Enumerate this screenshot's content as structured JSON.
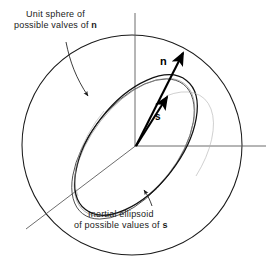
{
  "figure": {
    "background_color": "#ffffff",
    "stroke_color": "#1a1a1a",
    "accent_color": "#000000",
    "width": 280,
    "height": 267
  },
  "annotations": {
    "sphere_label": {
      "line1": "Unit sphere of",
      "line2_prefix": "possible valves of ",
      "line2_symbol": "n"
    },
    "ellipsoid_label": {
      "line1": "Inertial ellipsoid",
      "line2_prefix": "of possible values of ",
      "line2_symbol": "s"
    }
  },
  "vectors": {
    "n": {
      "label": "n",
      "origin": [
        136,
        146
      ],
      "tip": [
        184,
        52
      ]
    },
    "s": {
      "label": "s",
      "origin": [
        136,
        146
      ],
      "tip": [
        167,
        96
      ]
    }
  },
  "shapes": {
    "unit_sphere": {
      "name": "unit-sphere-circle",
      "center": [
        132,
        145
      ],
      "radius": 110
    },
    "inertial_ellipsoid": {
      "name": "inertial-ellipsoid",
      "center": [
        135,
        146
      ],
      "semi_major": 82,
      "semi_minor": 44,
      "rotation_deg": -52
    }
  },
  "axes": {
    "vertical": {
      "x1": 135,
      "y1": 13,
      "x2": 135,
      "y2": 146
    },
    "horizontal": {
      "x1": 136,
      "y1": 146,
      "x2": 266,
      "y2": 146
    },
    "depth": {
      "x1": 136,
      "y1": 146,
      "x2": 28,
      "y2": 228
    }
  }
}
